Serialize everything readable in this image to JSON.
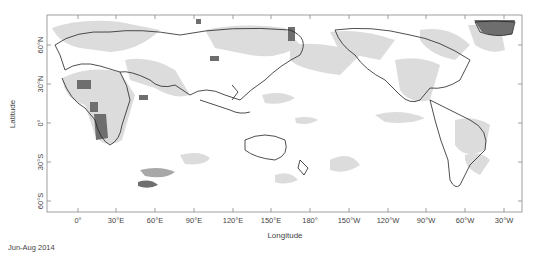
{
  "map": {
    "caption": "Jun-Aug 2014",
    "xlabel": "Longitude",
    "ylabel": "Latitude",
    "x_ticks": [
      {
        "label": "0°",
        "x": 78
      },
      {
        "label": "30°E",
        "x": 116
      },
      {
        "label": "60°E",
        "x": 155
      },
      {
        "label": "90°E",
        "x": 194
      },
      {
        "label": "120°E",
        "x": 233
      },
      {
        "label": "150°E",
        "x": 271
      },
      {
        "label": "180°",
        "x": 310
      },
      {
        "label": "150°W",
        "x": 349
      },
      {
        "label": "120°W",
        "x": 388
      },
      {
        "label": "90°W",
        "x": 426
      },
      {
        "label": "60°W",
        "x": 465
      },
      {
        "label": "30°W",
        "x": 504
      }
    ],
    "y_ticks": [
      {
        "label": "60°N",
        "y": 45
      },
      {
        "label": "30°N",
        "y": 84
      },
      {
        "label": "0°",
        "y": 123
      },
      {
        "label": "30°S",
        "y": 162
      },
      {
        "label": "60°S",
        "y": 201
      }
    ],
    "frame": {
      "left": 47,
      "top": 15,
      "right": 522,
      "bottom": 212
    },
    "colors": {
      "frame": "#888888",
      "light_shade": "#d9d9d9",
      "dark_shade": "#6e6e6e",
      "coast": "#222222"
    }
  }
}
